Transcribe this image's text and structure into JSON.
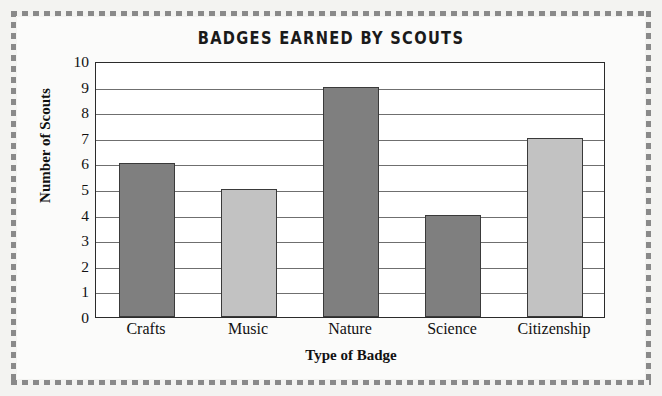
{
  "chart_data": {
    "type": "bar",
    "title": "BADGES EARNED BY SCOUTS",
    "xlabel": "Type of Badge",
    "ylabel": "Number of Scouts",
    "categories": [
      "Crafts",
      "Music",
      "Nature",
      "Science",
      "Citizenship"
    ],
    "values": [
      6,
      5,
      9,
      4,
      7
    ],
    "bar_colors": [
      "#7f7f7f",
      "#c2c2c2",
      "#7f7f7f",
      "#7f7f7f",
      "#c2c2c2"
    ],
    "ylim": [
      0,
      10
    ],
    "ytick_labels": [
      "0",
      "1",
      "2",
      "3",
      "4",
      "5",
      "6",
      "7",
      "8",
      "9",
      "10"
    ],
    "ytick_values": [
      0,
      1,
      2,
      3,
      4,
      5,
      6,
      7,
      8,
      9,
      10
    ],
    "grid": true,
    "grid_axis": "y",
    "legend": false,
    "series": [
      {
        "name": "Number of Scouts",
        "values": [
          6,
          5,
          9,
          4,
          7
        ]
      }
    ]
  },
  "style": {
    "page_background": "#f3f3f1",
    "card_background": "#fbfbfa",
    "plot_background": "#ffffff",
    "axis_color": "#2b2b2b",
    "gridline_color": "#6f6f6f",
    "border_dash_color": "#898989",
    "bar_outline_color": "#3a3a3a",
    "bar_dark": "#7f7f7f",
    "bar_light": "#c2c2c2",
    "text_color": "#111111"
  }
}
